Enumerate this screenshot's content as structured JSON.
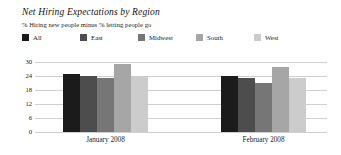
{
  "chart_data": {
    "type": "bar",
    "title": "Net Hiring Expectations by Region",
    "subtitle": "% Hiring new people minus % letting people go",
    "xlabel": "",
    "ylabel": "",
    "ylim": [
      0,
      30
    ],
    "yticks": [
      "30",
      "24",
      "18",
      "12",
      "6",
      "0"
    ],
    "grid": true,
    "legend_position": "top-left",
    "categories": [
      "January 2008",
      "February 2008"
    ],
    "series": [
      {
        "name": "All",
        "color": "#1b1b1b",
        "values": [
          25,
          24
        ]
      },
      {
        "name": "East",
        "color": "#4d4d4d",
        "values": [
          24,
          23
        ]
      },
      {
        "name": "Midwest",
        "color": "#767676",
        "values": [
          23,
          21
        ]
      },
      {
        "name": "South",
        "color": "#a6a6a6",
        "values": [
          29,
          28
        ]
      },
      {
        "name": "West",
        "color": "#cccccc",
        "values": [
          24,
          23
        ]
      }
    ]
  },
  "legend": {
    "items": [
      {
        "label": "All"
      },
      {
        "label": "East"
      },
      {
        "label": "Midwest"
      },
      {
        "label": "South"
      },
      {
        "label": "West"
      }
    ]
  }
}
